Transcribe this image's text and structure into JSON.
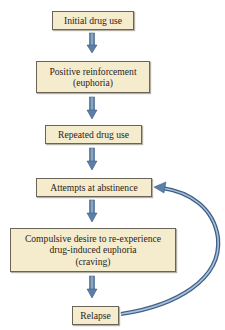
{
  "diagram": {
    "type": "flowchart",
    "colors": {
      "box_fill": "#f5ecce",
      "box_border": "#6a6458",
      "arrow": "#5b7fa8",
      "text": "#2a2520"
    },
    "nodes": [
      {
        "id": "initial",
        "lines": [
          "Initial drug use"
        ]
      },
      {
        "id": "reinforcement",
        "lines": [
          "Positive reinforcement",
          "(euphoria)"
        ]
      },
      {
        "id": "repeated",
        "lines": [
          "Repeated drug use"
        ]
      },
      {
        "id": "abstinence",
        "lines": [
          "Attempts at abstinence"
        ]
      },
      {
        "id": "craving",
        "lines": [
          "Compulsive desire to re-experience",
          "drug-induced euphoria",
          "(craving)"
        ]
      },
      {
        "id": "relapse",
        "lines": [
          "Relapse"
        ]
      }
    ],
    "edges": [
      {
        "from": "initial",
        "to": "reinforcement"
      },
      {
        "from": "reinforcement",
        "to": "repeated"
      },
      {
        "from": "repeated",
        "to": "abstinence"
      },
      {
        "from": "abstinence",
        "to": "craving"
      },
      {
        "from": "craving",
        "to": "relapse"
      },
      {
        "from": "relapse",
        "to": "abstinence",
        "style": "curved-loop"
      }
    ]
  }
}
